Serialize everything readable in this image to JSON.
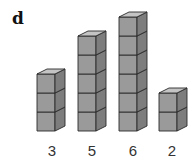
{
  "panel": {
    "label": "d"
  },
  "chart_data": {
    "type": "bar",
    "title": "",
    "categories": [
      "3",
      "5",
      "6",
      "2"
    ],
    "values": [
      3,
      5,
      6,
      2
    ],
    "xlabel": "",
    "ylabel": "",
    "representation": "stacked unit cubes",
    "grid": false,
    "legend": null
  },
  "columns": [
    {
      "count": 3,
      "label": "3"
    },
    {
      "count": 5,
      "label": "5"
    },
    {
      "count": 6,
      "label": "6"
    },
    {
      "count": 2,
      "label": "2"
    }
  ],
  "colors": {
    "front": "#9a9a9a",
    "side": "#7d7d7d",
    "top": "#c4c4c4",
    "edge": "#2a2a2a"
  }
}
